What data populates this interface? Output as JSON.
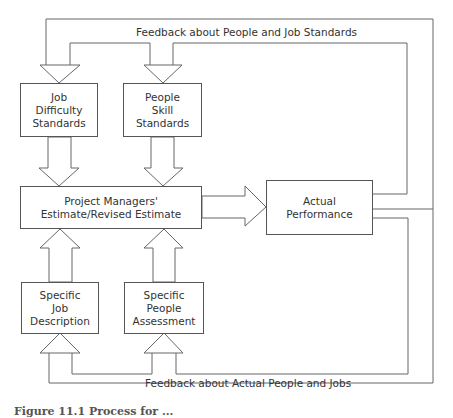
{
  "diagram": {
    "feedback_top_label": "Feedback about People and Job Standards",
    "feedback_bottom_label": "Feedback about Actual People and Jobs",
    "nodes": {
      "job_difficulty": {
        "lines": [
          "Job",
          "Difficulty",
          "Standards"
        ]
      },
      "people_skill": {
        "lines": [
          "People",
          "Skill",
          "Standards"
        ]
      },
      "estimate": {
        "lines": [
          "Project Managers'",
          "Estimate/Revised Estimate"
        ]
      },
      "actual_performance": {
        "lines": [
          "Actual",
          "Performance"
        ]
      },
      "job_description": {
        "lines": [
          "Specific",
          "Job",
          "Description"
        ]
      },
      "people_assessment": {
        "lines": [
          "Specific",
          "People",
          "Assessment"
        ]
      }
    },
    "edges": [
      {
        "from": "job_difficulty",
        "to": "estimate"
      },
      {
        "from": "people_skill",
        "to": "estimate"
      },
      {
        "from": "job_description",
        "to": "estimate"
      },
      {
        "from": "people_assessment",
        "to": "estimate"
      },
      {
        "from": "estimate",
        "to": "actual_performance"
      },
      {
        "from": "actual_performance",
        "to": "job_difficulty",
        "label": "Feedback about People and Job Standards"
      },
      {
        "from": "actual_performance",
        "to": "people_skill",
        "label": "Feedback about People and Job Standards"
      },
      {
        "from": "actual_performance",
        "to": "job_description",
        "label": "Feedback about Actual People and Jobs"
      },
      {
        "from": "actual_performance",
        "to": "people_assessment",
        "label": "Feedback about Actual People and Jobs"
      }
    ],
    "caption": "Figure 11.1  Process for ..."
  }
}
